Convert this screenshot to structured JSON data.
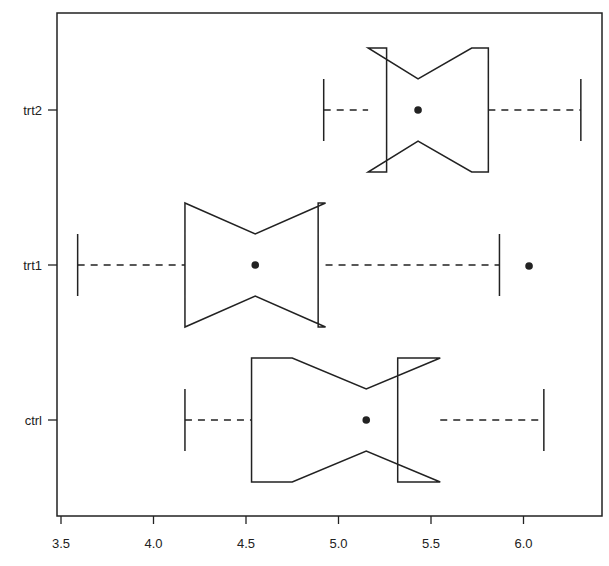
{
  "chart_data": {
    "type": "boxplot",
    "orientation": "horizontal",
    "notched": true,
    "title": "",
    "xlabel": "",
    "ylabel": "",
    "xlim": [
      3.48,
      6.4
    ],
    "x_ticks": [
      3.5,
      4.0,
      4.5,
      5.0,
      5.5,
      6.0
    ],
    "x_tick_labels": [
      "3.5",
      "4.0",
      "4.5",
      "5.0",
      "5.5",
      "6.0"
    ],
    "categories": [
      "ctrl",
      "trt1",
      "trt2"
    ],
    "grid": false,
    "legend": null,
    "series": [
      {
        "name": "ctrl",
        "whisker_low": 4.17,
        "q1": 4.53,
        "median": 5.15,
        "q3": 5.32,
        "whisker_high": 6.11,
        "notch_low": 4.75,
        "notch_high": 5.55,
        "outliers": []
      },
      {
        "name": "trt1",
        "whisker_low": 3.59,
        "q1": 4.17,
        "median": 4.55,
        "q3": 4.89,
        "whisker_high": 5.87,
        "notch_low": 4.17,
        "notch_high": 4.93,
        "outliers": [
          6.03
        ]
      },
      {
        "name": "trt2",
        "whisker_low": 4.92,
        "q1": 5.26,
        "median": 5.43,
        "q3": 5.81,
        "whisker_high": 6.31,
        "notch_low": 5.16,
        "notch_high": 5.72,
        "outliers": []
      }
    ]
  },
  "colors": {
    "stroke": "#222222",
    "background": "#ffffff"
  }
}
